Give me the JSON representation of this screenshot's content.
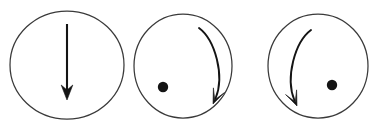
{
  "figure": {
    "background_color": "#ffffff",
    "width": 378,
    "height": 128,
    "stroke_color": "#141414",
    "circle_stroke_color": "#3a3a3a",
    "dot_color": "#141414"
  },
  "panels": [
    {
      "id": "panel-1",
      "label": "straight-down-arrow",
      "circle": {
        "cx": 67,
        "cy": 65,
        "rx": 57,
        "ry": 54
      },
      "arrow": {
        "type": "straight",
        "direction": "down",
        "start": {
          "x": 67,
          "y": 24
        },
        "end": {
          "x": 67,
          "y": 100
        }
      },
      "dot": null
    },
    {
      "id": "panel-2",
      "label": "clockwise-curved-arrow-with-left-dot",
      "circle": {
        "cx": 183,
        "cy": 66,
        "rx": 49,
        "ry": 52
      },
      "arrow": {
        "type": "curve",
        "direction": "clockwise",
        "start": {
          "x": 199,
          "y": 28
        },
        "end": {
          "x": 213,
          "y": 104
        }
      },
      "dot": {
        "cx": 163,
        "cy": 87,
        "r": 5.2
      }
    },
    {
      "id": "panel-3",
      "label": "counterclockwise-curved-arrow-with-right-dot",
      "circle": {
        "cx": 318,
        "cy": 66,
        "rx": 50,
        "ry": 52
      },
      "arrow": {
        "type": "curve",
        "direction": "counterclockwise",
        "start": {
          "x": 311,
          "y": 30
        },
        "end": {
          "x": 297,
          "y": 106
        }
      },
      "dot": {
        "cx": 332,
        "cy": 85,
        "r": 5.2
      }
    }
  ]
}
